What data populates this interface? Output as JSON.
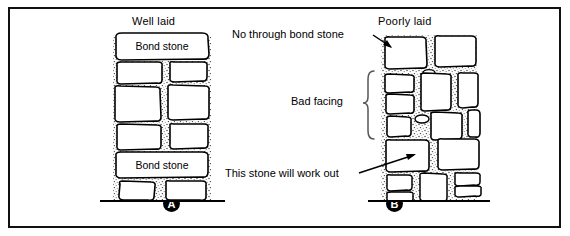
{
  "figure": {
    "background": "#ffffff",
    "border_color": "#111111"
  },
  "panels": [
    {
      "id": "A",
      "badge": "A",
      "title": "Well laid"
    },
    {
      "id": "B",
      "badge": "B",
      "title": "Poorly laid"
    }
  ],
  "stone_labels": [
    {
      "text": "Bond stone"
    },
    {
      "text": "Bond stone"
    }
  ],
  "annotations": [
    {
      "text": "No through bond stone"
    },
    {
      "text": "Bad facing"
    },
    {
      "text": "This stone will work out"
    }
  ],
  "colors": {
    "stone_fill": "#ffffff",
    "stone_stroke": "#000000",
    "mortar": "#8d8d8d",
    "ground": "#000000",
    "badge_bg": "#000000",
    "badge_text": "#ffffff"
  }
}
